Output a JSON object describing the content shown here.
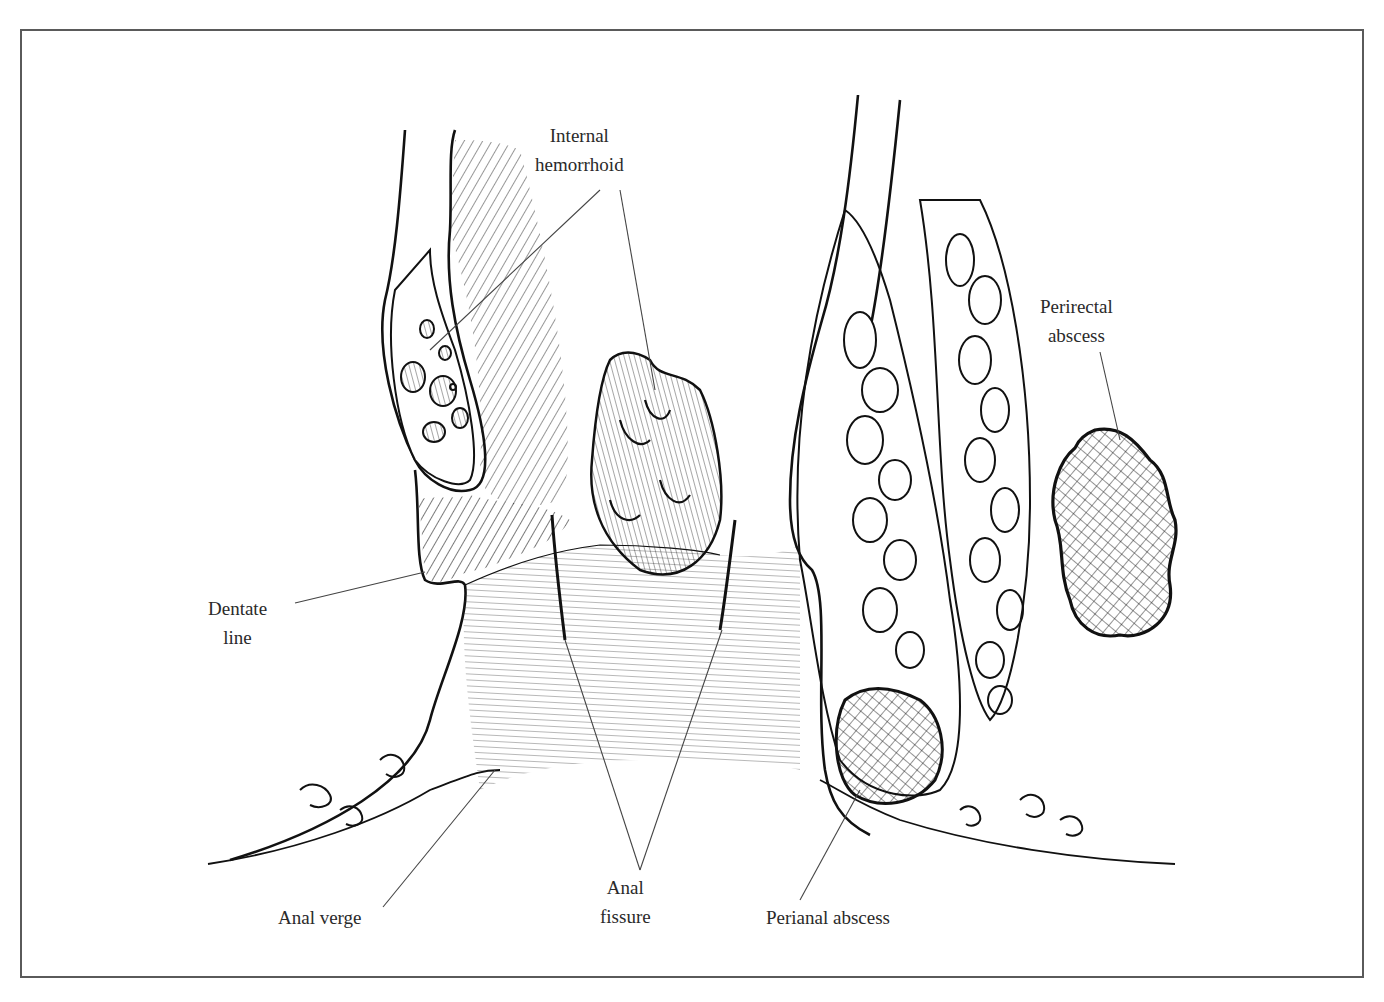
{
  "figure": {
    "labels": {
      "internal_hemorrhoid": [
        "Internal",
        "hemorrhoid"
      ],
      "perirectal_abscess": [
        "Perirectal",
        "abscess"
      ],
      "dentate_line": [
        "Dentate",
        "line"
      ],
      "anal_verge": "Anal verge",
      "anal_fissure": [
        "Anal",
        "fissure"
      ],
      "perianal_abscess": "Perianal abscess"
    },
    "colors": {
      "ink": "#111111",
      "leader": "#444444",
      "frame": "#5a5a5a",
      "background": "#ffffff"
    }
  }
}
